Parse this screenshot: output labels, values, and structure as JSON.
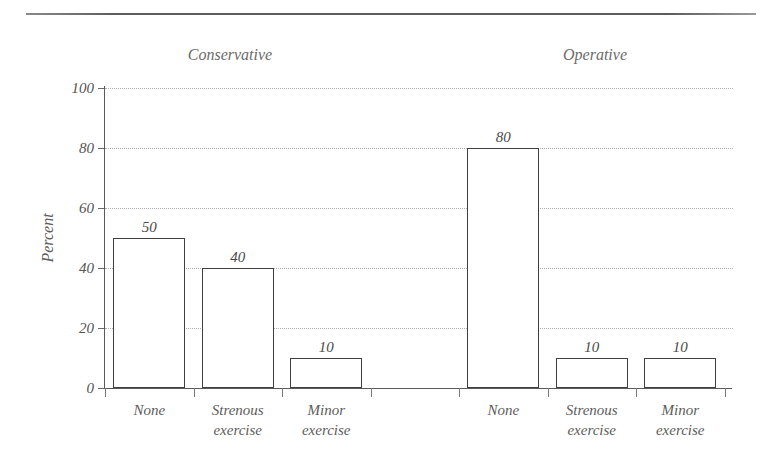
{
  "chart_data": {
    "type": "bar",
    "title": "",
    "xlabel": "",
    "ylabel": "Percent",
    "ylim": [
      0,
      100
    ],
    "yticks": [
      0,
      20,
      40,
      60,
      80,
      100
    ],
    "ytick_labels": [
      "0",
      "20",
      "40",
      "60",
      "80",
      "100"
    ],
    "grid": true,
    "legend": "none",
    "groups": [
      {
        "label": "Conservative",
        "categories": [
          "None",
          "Strenous exercise",
          "Minor exercise"
        ],
        "values": [
          50,
          40,
          10
        ],
        "value_labels": [
          "50",
          "40",
          "10"
        ]
      },
      {
        "label": "Operative",
        "categories": [
          "None",
          "Strenous exercise",
          "Minor exercise"
        ],
        "values": [
          80,
          10,
          10
        ],
        "value_labels": [
          "80",
          "10",
          "10"
        ]
      }
    ],
    "categories": [
      "None",
      "Strenous exercise",
      "Minor exercise",
      "None",
      "Strenous exercise",
      "Minor exercise"
    ],
    "values": [
      50,
      40,
      10,
      80,
      10,
      10
    ],
    "bar_style": {
      "fill": "#ffffff",
      "edge": "#3f3f3f"
    },
    "grid_color": "#b0b0b0",
    "axis_color": "#5a5a5a",
    "text_color": "#5c5c5c"
  },
  "axis": {
    "y_title": "Percent"
  },
  "category_lines": [
    {
      "line1": "None",
      "line2": ""
    },
    {
      "line1": "Strenous",
      "line2": "exercise"
    },
    {
      "line1": "Minor",
      "line2": "exercise"
    },
    {
      "line1": "None",
      "line2": ""
    },
    {
      "line1": "Strenous",
      "line2": "exercise"
    },
    {
      "line1": "Minor",
      "line2": "exercise"
    }
  ]
}
